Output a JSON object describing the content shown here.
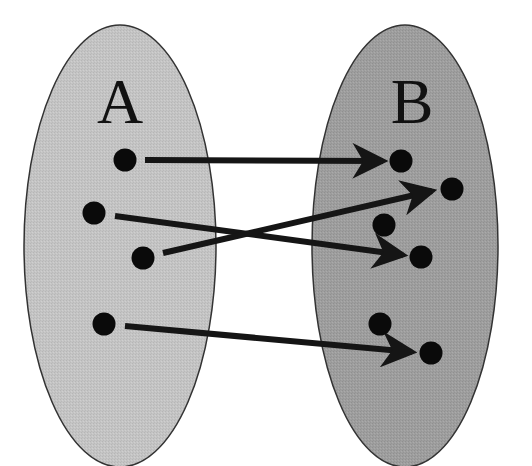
{
  "diagram": {
    "type": "function-mapping",
    "colors": {
      "background": "#ffffff",
      "set_a_fill": "#c3c3c3",
      "set_b_fill": "#9d9d9d",
      "outline": "#333333",
      "point": "#0a0a0a",
      "arrow": "#151515"
    },
    "sets": [
      {
        "id": "A",
        "label": "A",
        "cx": 120,
        "cy": 246,
        "rx": 96,
        "ry": 221,
        "label_x": 120,
        "label_y": 123,
        "points": [
          {
            "id": "a1",
            "x": 125,
            "y": 160
          },
          {
            "id": "a2",
            "x": 94,
            "y": 213
          },
          {
            "id": "a3",
            "x": 143,
            "y": 258
          },
          {
            "id": "a4",
            "x": 104,
            "y": 324
          }
        ]
      },
      {
        "id": "B",
        "label": "B",
        "cx": 405,
        "cy": 246,
        "rx": 93,
        "ry": 221,
        "label_x": 412,
        "label_y": 123,
        "points": [
          {
            "id": "b1",
            "x": 401,
            "y": 161
          },
          {
            "id": "b2",
            "x": 452,
            "y": 189
          },
          {
            "id": "b3",
            "x": 384,
            "y": 225
          },
          {
            "id": "b4",
            "x": 421,
            "y": 257
          },
          {
            "id": "b5",
            "x": 380,
            "y": 324
          },
          {
            "id": "b6",
            "x": 431,
            "y": 353
          }
        ]
      }
    ],
    "arrows": [
      {
        "from": "a1",
        "to": "b1",
        "x1": 145,
        "y1": 160,
        "x2": 383,
        "y2": 161
      },
      {
        "from": "a2",
        "to": "b4",
        "x1": 115,
        "y1": 216,
        "x2": 403,
        "y2": 255
      },
      {
        "from": "a3",
        "to": "b2",
        "x1": 163,
        "y1": 253,
        "x2": 432,
        "y2": 191
      },
      {
        "from": "a4",
        "to": "b6",
        "x1": 125,
        "y1": 326,
        "x2": 412,
        "y2": 352
      }
    ]
  }
}
